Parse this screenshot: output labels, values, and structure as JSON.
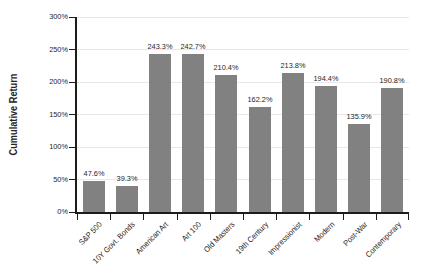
{
  "chart_data": {
    "type": "bar",
    "title": "",
    "ylabel": "Cumulative Return",
    "xlabel": "",
    "categories": [
      "S&P 500",
      "10Y Govt. Bonds",
      "American Art",
      "Art 100",
      "Old Masters",
      "19th Century",
      "Impressionist",
      "Modern",
      "Post-War",
      "Contemporary"
    ],
    "values": [
      47.6,
      39.3,
      243.3,
      242.7,
      210.4,
      162.2,
      213.8,
      194.4,
      135.9,
      190.8
    ],
    "data_labels": [
      "47.6%",
      "39.3%",
      "243.3%",
      "242.7%",
      "210.4%",
      "162.2%",
      "213.8%",
      "194.4%",
      "135.9%",
      "190.8%"
    ],
    "ylim": [
      0,
      300
    ],
    "ytick_labels": [
      "300%",
      "250%",
      "200%",
      "150%",
      "100%",
      "50%",
      "0%"
    ],
    "grid": "horizontal",
    "legend": "none",
    "colors": {
      "bar": "#818181",
      "axis": "#1c1c1c",
      "grid": "#e8e8e8",
      "text": "#262626",
      "background": "#ffffff"
    }
  }
}
